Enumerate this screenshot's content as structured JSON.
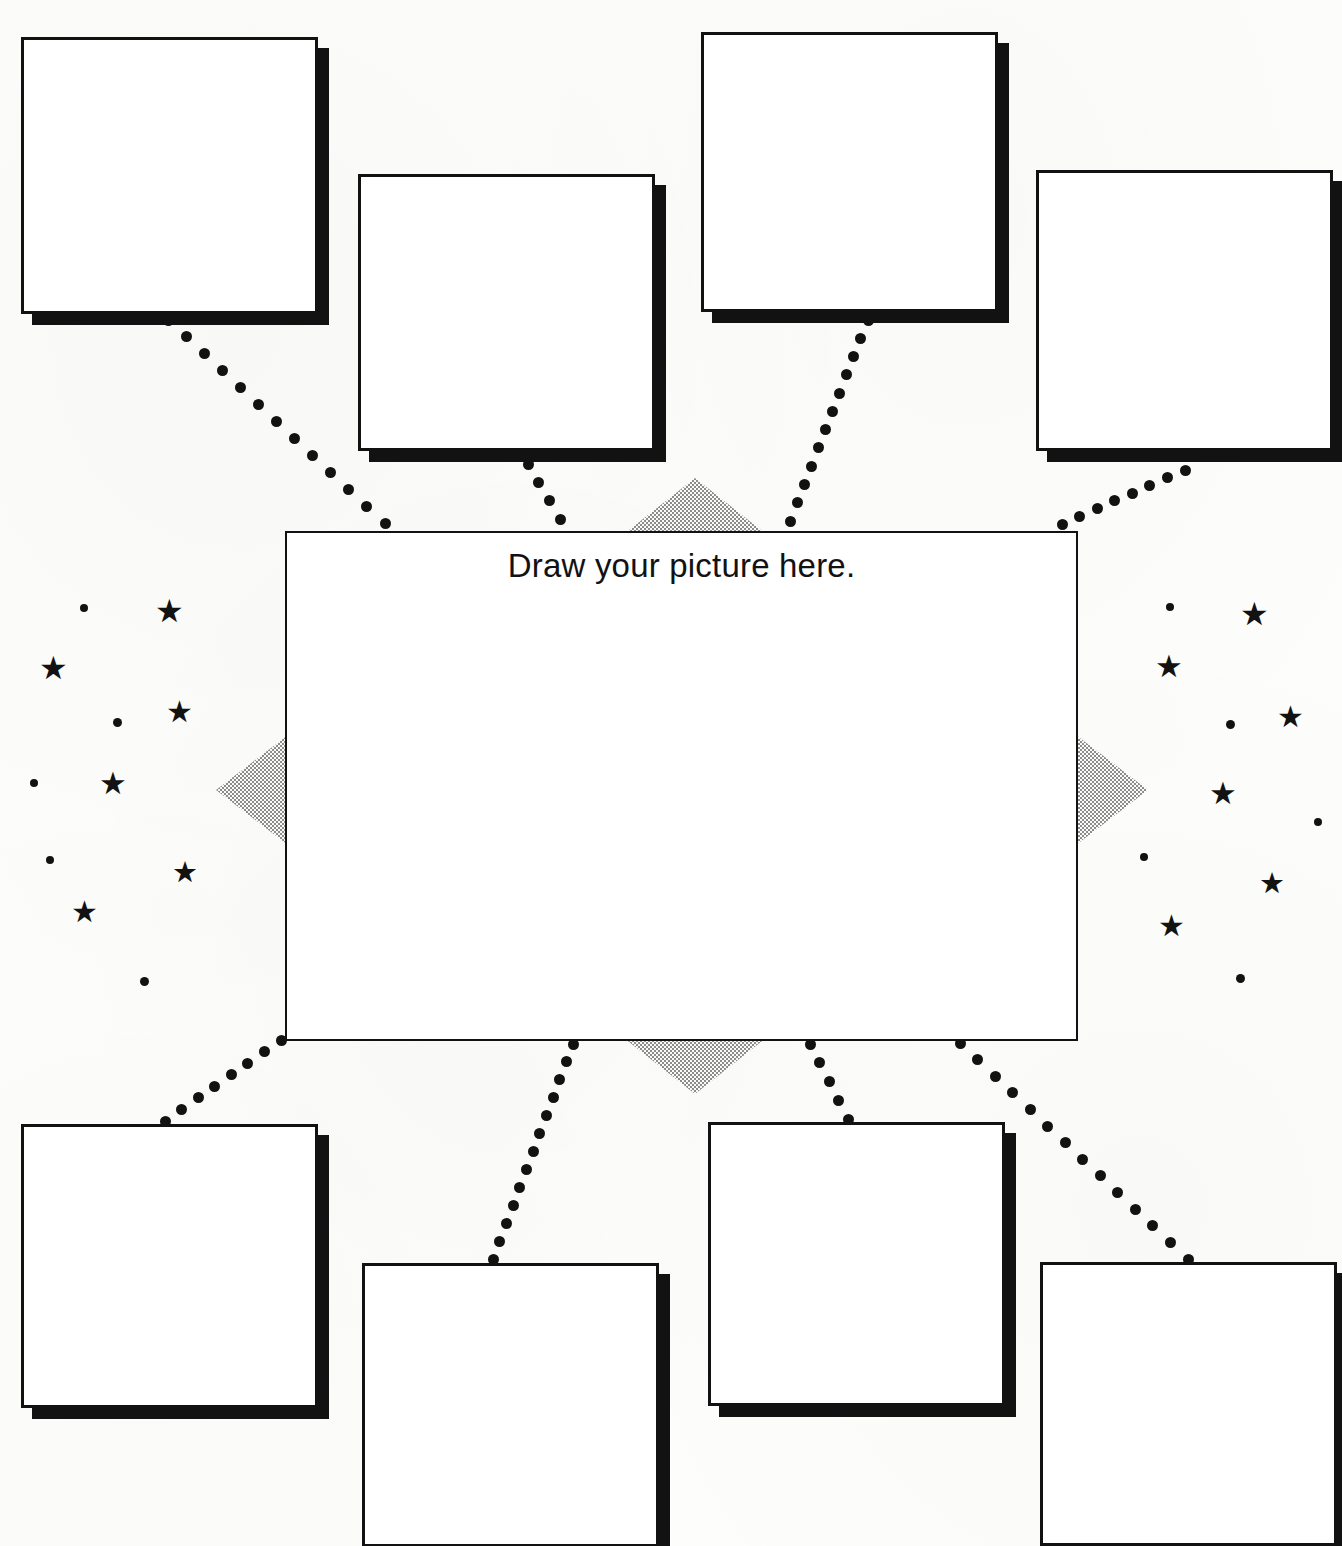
{
  "worksheet": {
    "title": "Draw your picture here.",
    "background_color": "#fdfdfc",
    "ink_color": "#121212",
    "halftone_color": "#8c8c8c",
    "center_box": {
      "label": "Draw your picture here.",
      "x": 285,
      "y": 531,
      "width": 793,
      "height": 510,
      "border_width": 2,
      "content": ""
    },
    "answer_boxes": [
      {
        "id": "box-top-left",
        "position": "top-left",
        "x": 21,
        "y": 37,
        "width": 297,
        "height": 277,
        "content": ""
      },
      {
        "id": "box-top-center-left",
        "position": "top-center-left",
        "x": 358,
        "y": 174,
        "width": 297,
        "height": 277,
        "content": ""
      },
      {
        "id": "box-top-center-right",
        "position": "top-center-right",
        "x": 701,
        "y": 32,
        "width": 297,
        "height": 280,
        "content": ""
      },
      {
        "id": "box-top-right",
        "position": "top-right",
        "x": 1036,
        "y": 170,
        "width": 297,
        "height": 281,
        "content": ""
      },
      {
        "id": "box-bottom-left",
        "position": "bottom-left",
        "x": 21,
        "y": 1124,
        "width": 297,
        "height": 284,
        "content": ""
      },
      {
        "id": "box-bottom-center-left",
        "position": "bottom-center-left",
        "x": 362,
        "y": 1263,
        "width": 297,
        "height": 284,
        "content": ""
      },
      {
        "id": "box-bottom-center-right",
        "position": "bottom-center-right",
        "x": 708,
        "y": 1122,
        "width": 297,
        "height": 284,
        "content": ""
      },
      {
        "id": "box-bottom-right",
        "position": "bottom-right",
        "x": 1040,
        "y": 1262,
        "width": 297,
        "height": 284,
        "content": ""
      }
    ],
    "connectors": [
      {
        "id": "connector-top-left",
        "from": "box-top-left",
        "to": "center_box",
        "x1": 168,
        "y1": 320,
        "x2": 385,
        "y2": 523,
        "dots": 13
      },
      {
        "id": "connector-top-center-left",
        "from": "box-top-center-left",
        "to": "center_box",
        "x1": 528,
        "y1": 464,
        "x2": 560,
        "y2": 519,
        "dots": 4
      },
      {
        "id": "connector-top-center-right",
        "from": "box-top-center-right",
        "to": "center_box",
        "x1": 868,
        "y1": 320,
        "x2": 790,
        "y2": 521,
        "dots": 12
      },
      {
        "id": "connector-top-right",
        "from": "box-top-right",
        "to": "center_box",
        "x1": 1185,
        "y1": 470,
        "x2": 1062,
        "y2": 524,
        "dots": 8
      },
      {
        "id": "connector-bottom-left",
        "from": "center_box",
        "to": "box-bottom-left",
        "x1": 281,
        "y1": 1040,
        "x2": 165,
        "y2": 1121,
        "dots": 8
      },
      {
        "id": "connector-bottom-center-left",
        "from": "center_box",
        "to": "box-bottom-center-left",
        "x1": 573,
        "y1": 1044,
        "x2": 493,
        "y2": 1259,
        "dots": 13
      },
      {
        "id": "connector-bottom-center-right",
        "from": "center_box",
        "to": "box-bottom-center-right",
        "x1": 810,
        "y1": 1044,
        "x2": 848,
        "y2": 1119,
        "dots": 5
      },
      {
        "id": "connector-bottom-right",
        "from": "center_box",
        "to": "box-bottom-right",
        "x1": 960,
        "y1": 1043,
        "x2": 1188,
        "y2": 1259,
        "dots": 14
      }
    ],
    "halftone_triangles": [
      {
        "id": "burst-triangle-top",
        "direction": "up",
        "x": 624,
        "y": 478,
        "width": 142,
        "height": 56
      },
      {
        "id": "burst-triangle-bottom",
        "direction": "down",
        "x": 624,
        "y": 1038,
        "width": 142,
        "height": 56
      },
      {
        "id": "burst-triangle-left",
        "direction": "left",
        "x": 216,
        "y": 735,
        "width": 72,
        "height": 110
      },
      {
        "id": "burst-triangle-right",
        "direction": "right",
        "x": 1076,
        "y": 735,
        "width": 72,
        "height": 110
      }
    ],
    "decorations": {
      "star_glyph": "★",
      "stars_left": [
        {
          "x": 155,
          "y": 595,
          "size": 32
        },
        {
          "x": 39,
          "y": 652,
          "size": 32
        },
        {
          "x": 166,
          "y": 697,
          "size": 30
        },
        {
          "x": 99,
          "y": 768,
          "size": 31
        },
        {
          "x": 172,
          "y": 858,
          "size": 29
        },
        {
          "x": 71,
          "y": 897,
          "size": 30
        }
      ],
      "stars_right": [
        {
          "x": 1240,
          "y": 598,
          "size": 32
        },
        {
          "x": 1155,
          "y": 651,
          "size": 31
        },
        {
          "x": 1277,
          "y": 702,
          "size": 30
        },
        {
          "x": 1209,
          "y": 778,
          "size": 31
        },
        {
          "x": 1259,
          "y": 869,
          "size": 29
        },
        {
          "x": 1158,
          "y": 911,
          "size": 30
        }
      ],
      "specks_left": [
        {
          "x": 80,
          "y": 604,
          "size": 8
        },
        {
          "x": 113,
          "y": 718,
          "size": 9
        },
        {
          "x": 30,
          "y": 779,
          "size": 8
        },
        {
          "x": 46,
          "y": 856,
          "size": 8
        },
        {
          "x": 140,
          "y": 977,
          "size": 9
        }
      ],
      "specks_right": [
        {
          "x": 1166,
          "y": 603,
          "size": 8
        },
        {
          "x": 1226,
          "y": 720,
          "size": 9
        },
        {
          "x": 1314,
          "y": 818,
          "size": 8
        },
        {
          "x": 1140,
          "y": 853,
          "size": 8
        },
        {
          "x": 1236,
          "y": 974,
          "size": 9
        }
      ]
    }
  }
}
